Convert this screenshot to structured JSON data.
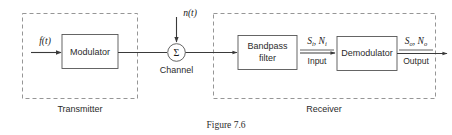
{
  "figure": {
    "caption": "Figure 7.6",
    "groups": [
      {
        "id": "transmitter",
        "label": "Transmitter"
      },
      {
        "id": "receiver",
        "label": "Receiver"
      }
    ],
    "blocks": [
      {
        "id": "modulator",
        "label": "Modulator"
      },
      {
        "id": "bandpass-filter",
        "line1": "Bandpass",
        "line2": "filter"
      },
      {
        "id": "demodulator",
        "label": "Demodulator"
      }
    ],
    "node": {
      "id": "channel-summer",
      "glyph": "Σ",
      "label": "Channel"
    },
    "signals": {
      "source": {
        "base": "f",
        "arg": "(t)"
      },
      "noise": {
        "base": "n",
        "arg": "(t)"
      },
      "input": {
        "s_base": "S",
        "s_sub": "i",
        "n_base": "N",
        "n_sub": "i",
        "comma": ", ",
        "caption": "Input"
      },
      "output": {
        "s_base": "S",
        "s_sub": "o",
        "n_base": "N",
        "n_sub": "o",
        "comma": ", ",
        "caption": "Output"
      }
    },
    "colors": {
      "wire": "#3a3a3a",
      "box_stroke": "#555555",
      "dash_stroke": "#8a8a8a",
      "text": "#2b2b2b",
      "background": "#ffffff"
    }
  }
}
